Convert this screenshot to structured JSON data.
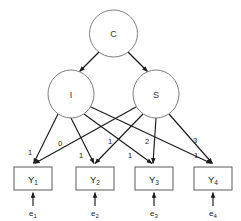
{
  "diagram": {
    "type": "sem-path-diagram",
    "title": "",
    "colors": {
      "background": "#ffffff",
      "ellipse_stroke": "#6f6f6f",
      "rect_stroke": "#5a5a5a",
      "path_stroke": "#1a1a1a",
      "text": "#1a1a1a"
    },
    "latent_factors": [
      {
        "id": "C",
        "label": "C",
        "cx": 113.5,
        "cy": 33.5,
        "rx": 24,
        "ry": 23.5
      },
      {
        "id": "I",
        "label": "I",
        "cx": 71,
        "cy": 94,
        "rx": 23,
        "ry": 24
      },
      {
        "id": "S",
        "label": "S",
        "cx": 156,
        "cy": 94,
        "rx": 23,
        "ry": 24
      }
    ],
    "indicators": [
      {
        "id": "Y1",
        "label": "Y",
        "subscript": "1",
        "x": 14,
        "y": 167,
        "w": 38,
        "h": 23
      },
      {
        "id": "Y2",
        "label": "Y",
        "subscript": "2",
        "x": 76,
        "y": 167,
        "w": 38,
        "h": 23
      },
      {
        "id": "Y3",
        "label": "Y",
        "subscript": "3",
        "x": 135,
        "y": 167,
        "w": 38,
        "h": 23
      },
      {
        "id": "Y4",
        "label": "Y",
        "subscript": "4",
        "x": 194,
        "y": 167,
        "w": 38,
        "h": 23
      }
    ],
    "residuals": [
      {
        "id": "e1",
        "label": "e",
        "subscript": "1",
        "x": 33,
        "y": 213
      },
      {
        "id": "e2",
        "label": "e",
        "subscript": "2",
        "x": 95,
        "y": 213
      },
      {
        "id": "e3",
        "label": "e",
        "subscript": "3",
        "x": 154,
        "y": 213
      },
      {
        "id": "e4",
        "label": "e",
        "subscript": "4",
        "x": 213,
        "y": 213
      }
    ],
    "second_order_paths": [
      {
        "id": "C-to-I",
        "from": "C",
        "to": "I",
        "label": ""
      },
      {
        "id": "C-to-S",
        "from": "C",
        "to": "S",
        "label": ""
      }
    ],
    "loadings": [
      {
        "id": "I-to-Y1",
        "from": "I",
        "to": "Y1",
        "value": "1",
        "lx": 30,
        "ly": 152
      },
      {
        "id": "I-to-Y2",
        "from": "I",
        "to": "Y2",
        "value": "1",
        "lx": 81,
        "ly": 155
      },
      {
        "id": "I-to-Y3",
        "from": "I",
        "to": "Y3",
        "value": "1",
        "lx": 130,
        "ly": 155
      },
      {
        "id": "I-to-Y4",
        "from": "I",
        "to": "Y4",
        "value": "1",
        "lx": 196,
        "ly": 155
      },
      {
        "id": "S-to-Y1",
        "from": "S",
        "to": "Y1",
        "value": "0",
        "lx": 60,
        "ly": 143
      },
      {
        "id": "S-to-Y2",
        "from": "S",
        "to": "Y2",
        "value": "1",
        "lx": 110,
        "ly": 141
      },
      {
        "id": "S-to-Y3",
        "from": "S",
        "to": "Y3",
        "value": "2",
        "lx": 147,
        "ly": 141
      },
      {
        "id": "S-to-Y4",
        "from": "S",
        "to": "Y4",
        "value": "3",
        "lx": 195,
        "ly": 140
      }
    ],
    "residual_paths": [
      {
        "id": "e1-to-Y1",
        "from": "e1",
        "to": "Y1"
      },
      {
        "id": "e2-to-Y2",
        "from": "e2",
        "to": "Y2"
      },
      {
        "id": "e3-to-Y3",
        "from": "e3",
        "to": "Y3"
      },
      {
        "id": "e4-to-Y4",
        "from": "e4",
        "to": "Y4"
      }
    ]
  }
}
